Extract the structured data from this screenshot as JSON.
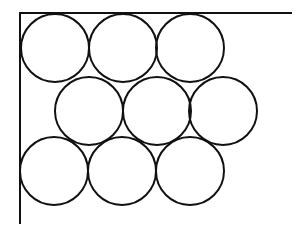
{
  "diagram": {
    "stroke_color": "#111111",
    "background_color": "#ffffff",
    "stroke_width": 2,
    "walls": {
      "top": {
        "x1": 20,
        "y1": 13,
        "x2": 291,
        "y2": 13
      },
      "left": {
        "x1": 20,
        "y1": 13,
        "x2": 20,
        "y2": 223
      }
    },
    "circle_radius": 34,
    "rows": [
      {
        "name": "top-row",
        "circles": [
          {
            "cx": 55,
            "cy": 48
          },
          {
            "cx": 123,
            "cy": 48
          },
          {
            "cx": 190,
            "cy": 48
          }
        ]
      },
      {
        "name": "middle-row",
        "circles": [
          {
            "cx": 89,
            "cy": 111
          },
          {
            "cx": 157,
            "cy": 111
          },
          {
            "cx": 223,
            "cy": 111
          }
        ]
      },
      {
        "name": "bottom-row",
        "circles": [
          {
            "cx": 54,
            "cy": 171
          },
          {
            "cx": 122,
            "cy": 171
          },
          {
            "cx": 190,
            "cy": 171
          }
        ]
      }
    ]
  }
}
